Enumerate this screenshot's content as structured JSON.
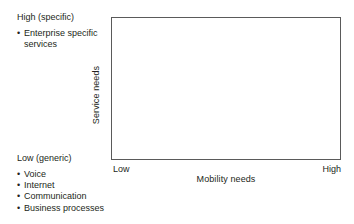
{
  "figure": {
    "name": "service-needs-vs-mobility-needs-quadrant",
    "colors": {
      "frame_stroke": "#5a5a5a",
      "text": "#231f20",
      "background": "#ffffff"
    }
  },
  "chart_data": {
    "type": "scatter",
    "title": "",
    "subtitle": "",
    "xlabel": "Mobility needs",
    "ylabel": "Service needs",
    "x_tick_labels": [
      "Low",
      "High"
    ],
    "y_tick_labels": [
      "Low (generic)",
      "High (specific)"
    ],
    "xlim": [
      "Low",
      "High"
    ],
    "ylim": [
      "Low (generic)",
      "High (specific)"
    ],
    "grid": false,
    "legend": null,
    "series": [],
    "values": [],
    "categories": [],
    "annotations": [
      {
        "position": "y-axis-high",
        "heading": "High (specific)",
        "items": [
          "Enterprise specific services"
        ]
      },
      {
        "position": "y-axis-low",
        "heading": "Low (generic)",
        "items": [
          "Voice",
          "Internet",
          "Communication",
          "Business processes"
        ]
      }
    ]
  },
  "axes": {
    "y_label": "Service needs",
    "x_label": "Mobility needs",
    "x_low": "Low",
    "x_high": "High"
  },
  "annotations": {
    "high": {
      "heading": "High (specific)",
      "bullet_glyph": "•",
      "items": [
        {
          "line1": "Enterprise specific",
          "line2": "services"
        }
      ]
    },
    "low": {
      "heading": "Low (generic)",
      "bullet_glyph": "•",
      "items": [
        {
          "line1": "Voice"
        },
        {
          "line1": "Internet"
        },
        {
          "line1": "Communication"
        },
        {
          "line1": "Business processes"
        }
      ]
    }
  }
}
